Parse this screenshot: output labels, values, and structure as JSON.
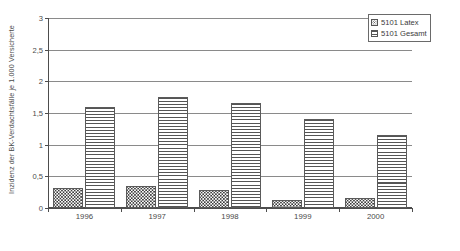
{
  "chart_data": {
    "type": "bar",
    "title": "",
    "subtitle": "",
    "xlabel": "",
    "ylabel": "Inzidenz der BK-Verdachtsfälle je 1.000 Versicherte",
    "categories": [
      "1996",
      "1997",
      "1998",
      "1999",
      "2000"
    ],
    "series": [
      {
        "name": "5101 Latex",
        "values": [
          0.31,
          0.35,
          0.29,
          0.13,
          0.16
        ]
      },
      {
        "name": "5101 Gesamt",
        "values": [
          1.6,
          1.75,
          1.66,
          1.4,
          1.15
        ]
      }
    ],
    "ylim": [
      0,
      3
    ],
    "ytick_values": [
      0,
      0.5,
      1,
      1.5,
      2,
      2.5,
      3
    ],
    "ytick_labels": [
      "0",
      "0,5",
      "1",
      "1,5",
      "2",
      "2,5",
      "3"
    ],
    "grid": true,
    "grid_axis": "y",
    "legend_position": "top-right",
    "colors": {
      "axis": "#4d4d4d",
      "gridline": "#8a8a8a",
      "bar_outline": "#5a5a5a",
      "hatch": "#555555",
      "text": "#4a4a4a",
      "background": "#ffffff"
    },
    "patterns": {
      "5101 Latex": "speckled-dots",
      "5101 Gesamt": "horizontal-lines"
    }
  },
  "legend": {
    "items": [
      {
        "label": "5101 Latex",
        "pattern": "speckled-dots"
      },
      {
        "label": "5101 Gesamt",
        "pattern": "horizontal-lines"
      }
    ]
  }
}
